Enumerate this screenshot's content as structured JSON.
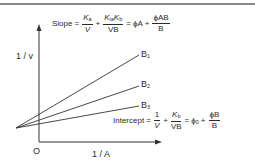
{
  "diagram": {
    "type": "double-reciprocal plot",
    "y_axis_label": "1 / v",
    "x_axis_label": "1 / A",
    "origin_label": "O",
    "lines": [
      {
        "label": "B",
        "subscript": "1"
      },
      {
        "label": "B",
        "subscript": "2"
      },
      {
        "label": "B",
        "subscript": "3"
      }
    ],
    "slope_equation": {
      "lhs": "Slope",
      "term1_num": "K",
      "term1_num_sub": "a",
      "term1_den": "V",
      "term2_num_a": "K",
      "term2_num_a_sub": "ia",
      "term2_num_b": "K",
      "term2_num_b_sub": "b",
      "term2_den": "VB",
      "rhs1": "ϕA",
      "rhs2_num": "ϕAB",
      "rhs2_den": "B"
    },
    "intercept_equation": {
      "lhs": "Intercept",
      "term1_num": "1",
      "term1_den": "V",
      "term2_num": "K",
      "term2_num_sub": "b",
      "term2_den": "VB",
      "rhs1": "ϕ",
      "rhs1_sub": "0",
      "rhs2_num": "ϕB",
      "rhs2_den": "B"
    },
    "colors": {
      "ink": "#2a2a2a",
      "frame_line": "#8a8a8a"
    }
  }
}
